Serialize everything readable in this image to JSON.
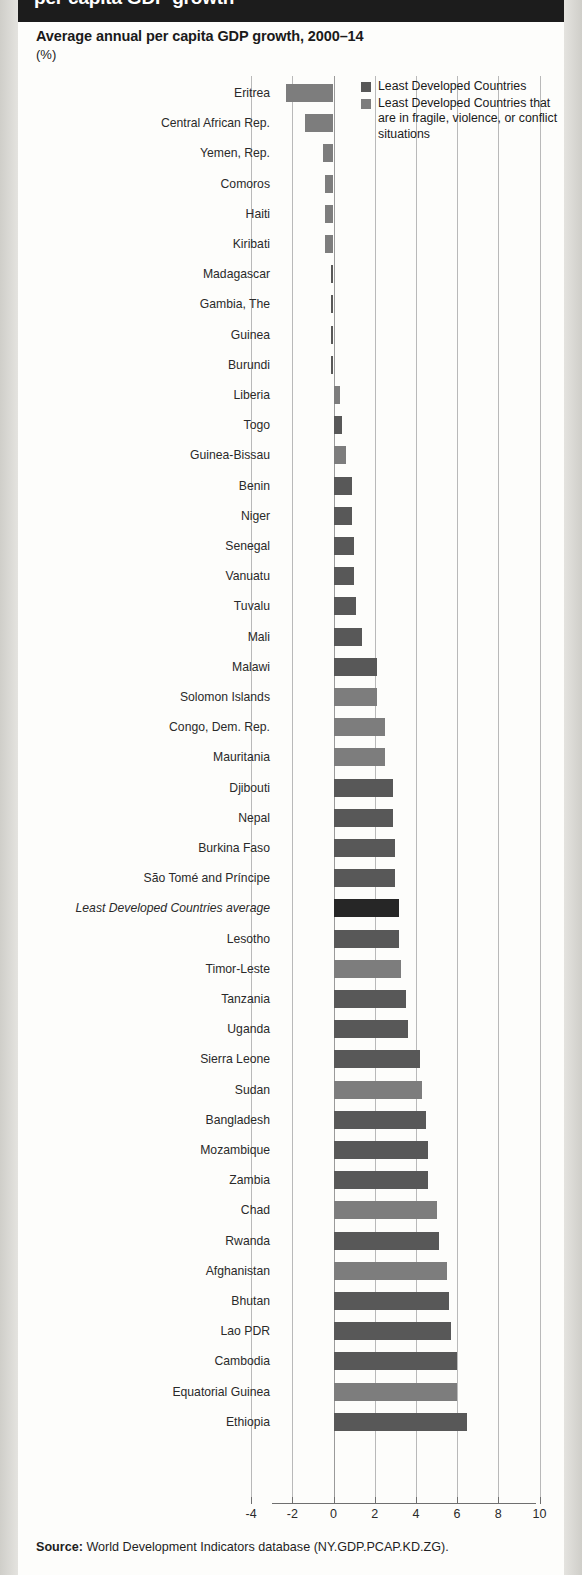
{
  "header": {
    "band_title": "per capita GDP growth"
  },
  "chart": {
    "title": "Average annual per capita GDP growth, 2000–14",
    "units": "(%)"
  },
  "legend": {
    "items": [
      {
        "label": "Least Developed Countries",
        "color": "#585858"
      },
      {
        "label": "Least Developed Countries that are in fragile, violence, or conflict situations",
        "color": "#7d7d7d"
      }
    ]
  },
  "source": {
    "prefix": "Source:",
    "text": " World Development Indicators database (NY.GDP.PCAP.KD.ZG)."
  },
  "colors": {
    "ldc": "#585858",
    "fragile": "#7d7d7d",
    "average": "#262626",
    "gridline": "#b9b9b9",
    "header_band": "#1c1c1c",
    "paper": "#fdfdfb"
  },
  "chart_data": {
    "type": "bar",
    "orientation": "horizontal",
    "title": "Average annual per capita GDP growth, 2000–14",
    "xlabel": "",
    "ylabel": "",
    "unit": "%",
    "xlim": [
      -4,
      10
    ],
    "xticks": [
      -4,
      -2,
      0,
      2,
      4,
      6,
      8,
      10
    ],
    "xtick_labels": [
      "-4",
      "-2",
      "0",
      "2",
      "4",
      "6",
      "8",
      "10"
    ],
    "grid": true,
    "legend_position": "top-right",
    "series_names": [
      "Least Developed Countries",
      "Least Developed Countries that are in fragile, violence, or conflict situations"
    ],
    "categories": [
      "Eritrea",
      "Central African Rep.",
      "Yemen, Rep.",
      "Comoros",
      "Haiti",
      "Kiribati",
      "Madagascar",
      "Gambia, The",
      "Guinea",
      "Burundi",
      "Liberia",
      "Togo",
      "Guinea-Bissau",
      "Benin",
      "Niger",
      "Senegal",
      "Vanuatu",
      "Tuvalu",
      "Mali",
      "Malawi",
      "Solomon Islands",
      "Congo, Dem. Rep.",
      "Mauritania",
      "Djibouti",
      "Nepal",
      "Burkina Faso",
      "São Tomé and Príncipe",
      "Least Developed Countries average",
      "Lesotho",
      "Timor-Leste",
      "Tanzania",
      "Uganda",
      "Sierra Leone",
      "Sudan",
      "Bangladesh",
      "Mozambique",
      "Zambia",
      "Chad",
      "Rwanda",
      "Afghanistan",
      "Bhutan",
      "Lao PDR",
      "Cambodia",
      "Equatorial Guinea",
      "Ethiopia"
    ],
    "values": [
      -2.3,
      -1.4,
      -0.5,
      -0.4,
      -0.4,
      -0.4,
      -0.1,
      -0.1,
      -0.1,
      -0.1,
      0.3,
      0.4,
      0.6,
      0.9,
      0.9,
      1.0,
      1.0,
      1.1,
      1.4,
      2.1,
      2.1,
      2.5,
      2.5,
      2.9,
      2.9,
      3.0,
      3.0,
      3.2,
      3.2,
      3.3,
      3.5,
      3.6,
      4.2,
      4.3,
      4.5,
      4.6,
      4.6,
      5.0,
      5.1,
      5.5,
      5.6,
      5.7,
      6.0,
      6.0,
      6.5
    ],
    "bar_group": [
      "fragile",
      "fragile",
      "fragile",
      "fragile",
      "fragile",
      "fragile",
      "ldc",
      "ldc",
      "ldc",
      "ldc",
      "fragile",
      "ldc",
      "fragile",
      "ldc",
      "ldc",
      "ldc",
      "ldc",
      "ldc",
      "ldc",
      "ldc",
      "fragile",
      "fragile",
      "fragile",
      "ldc",
      "ldc",
      "ldc",
      "ldc",
      "average",
      "ldc",
      "fragile",
      "ldc",
      "ldc",
      "ldc",
      "fragile",
      "ldc",
      "ldc",
      "ldc",
      "fragile",
      "ldc",
      "fragile",
      "ldc",
      "ldc",
      "ldc",
      "fragile",
      "ldc"
    ]
  }
}
